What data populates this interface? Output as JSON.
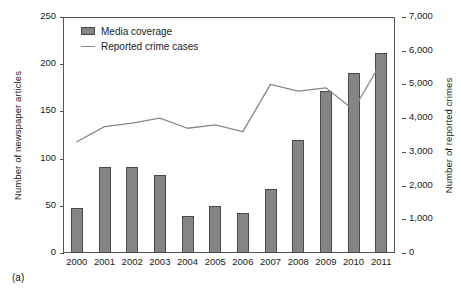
{
  "caption": "(a)",
  "legend": {
    "position": "top-left-inside",
    "items": [
      {
        "label": "Media coverage",
        "marker": "bar-swatch-icon",
        "color": "#858585"
      },
      {
        "label": "Reported crime cases",
        "marker": "line-swatch-icon",
        "color": "#888888"
      }
    ]
  },
  "axes": {
    "left": {
      "title": "Number of newspaper articles",
      "ticks": [
        "0",
        "50",
        "100",
        "150",
        "200",
        "250"
      ],
      "tick_values": [
        0,
        50,
        100,
        150,
        200,
        250
      ],
      "min": 0,
      "max": 250
    },
    "right": {
      "title": "Number of reported crimes",
      "ticks": [
        "0",
        "1,000",
        "2,000",
        "3,000",
        "4,000",
        "5,000",
        "6,000",
        "7,000"
      ],
      "tick_values": [
        0,
        1000,
        2000,
        3000,
        4000,
        5000,
        6000,
        7000
      ],
      "min": 0,
      "max": 7000
    },
    "x": {
      "title": "",
      "ticks": [
        "2000",
        "2001",
        "2002",
        "2003",
        "2004",
        "2005",
        "2006",
        "2007",
        "2008",
        "2009",
        "2010",
        "2011"
      ]
    }
  },
  "chart_data": {
    "type": "bar",
    "title": "",
    "subtitle": "",
    "xlabel": "",
    "ylabel": "Number of newspaper articles",
    "y2label": "Number of reported crimes",
    "ylim": [
      0,
      250
    ],
    "y2lim": [
      0,
      7000
    ],
    "grid": false,
    "legend_position": "upper left",
    "categories": [
      "2000",
      "2001",
      "2002",
      "2003",
      "2004",
      "2005",
      "2006",
      "2007",
      "2008",
      "2009",
      "2010",
      "2011"
    ],
    "series": [
      {
        "name": "Media coverage",
        "type": "bar",
        "axis": "left",
        "color": "#858585",
        "values": [
          48,
          91,
          91,
          83,
          39,
          50,
          42,
          68,
          120,
          172,
          191,
          212
        ]
      },
      {
        "name": "Reported crime cases",
        "type": "line",
        "axis": "right",
        "color": "#888888",
        "values": [
          3300,
          3750,
          3850,
          4000,
          3700,
          3800,
          3600,
          5000,
          4800,
          4900,
          4250,
          5650
        ]
      }
    ],
    "annotations": [
      "(a)"
    ]
  }
}
